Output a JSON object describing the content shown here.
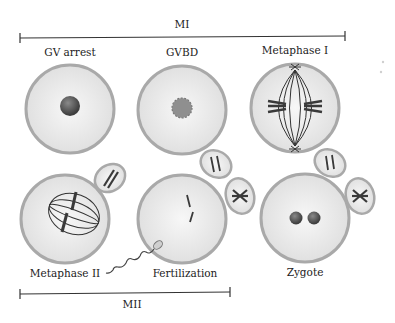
{
  "figure": {
    "phases": {
      "top": {
        "label": "MI",
        "x_start": 20,
        "x_end": 345,
        "y": 38
      },
      "bottom": {
        "label": "MII",
        "x_start": 20,
        "x_end": 230,
        "y": 292
      }
    },
    "stages": [
      {
        "id": "gv-arrest",
        "label": "GV arrest",
        "cx": 70,
        "cy": 109,
        "r": 45,
        "label_x": 70,
        "label_y": 52
      },
      {
        "id": "gvbd",
        "label": "GVBD",
        "cx": 182,
        "cy": 110,
        "r": 45,
        "label_x": 182,
        "label_y": 52
      },
      {
        "id": "metaphase-1",
        "label": "Metaphase I",
        "cx": 295,
        "cy": 108,
        "r": 45,
        "label_x": 295,
        "label_y": 50
      },
      {
        "id": "metaphase-2",
        "label": "Metaphase II",
        "cx": 65,
        "cy": 219,
        "r": 45,
        "label_x": 65,
        "label_y": 273
      },
      {
        "id": "fertilization",
        "label": "Fertilization",
        "cx": 182,
        "cy": 219,
        "r": 45,
        "label_x": 185,
        "label_y": 273
      },
      {
        "id": "zygote",
        "label": "Zygote",
        "cx": 305,
        "cy": 218,
        "r": 45,
        "label_x": 305,
        "label_y": 272
      }
    ],
    "colors": {
      "cell_fill": "#e6e6e6",
      "cell_border": "#a9a9a9",
      "nucleus": "#555555",
      "gvbd_nucleus": "#8a8a8a",
      "chromosome": "#3a3a3a",
      "line": "#333333"
    }
  }
}
